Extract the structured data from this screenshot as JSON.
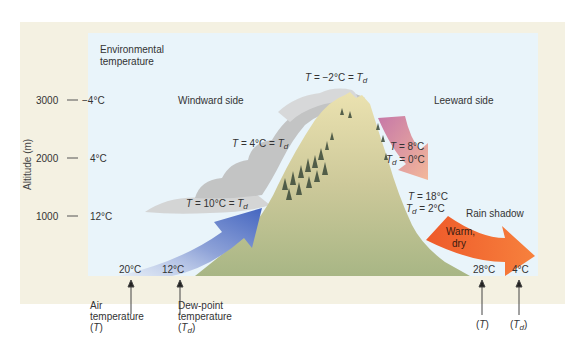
{
  "title_label": {
    "line1": "Environmental",
    "line2": "temperature"
  },
  "y_axis": {
    "label": "Altitude (m)",
    "ticks": [
      {
        "altitude": "3000",
        "temp": "−4°C"
      },
      {
        "altitude": "2000",
        "temp": "4°C"
      },
      {
        "altitude": "1000",
        "temp": "12°C"
      }
    ]
  },
  "regions": {
    "windward": "Windward side",
    "leeward": "Leeward side",
    "rain_shadow": "Rain shadow"
  },
  "windward_labels": {
    "t10": {
      "prefix": "T",
      "mid": " = 10°C = ",
      "suffix": "T",
      "sub": "d"
    },
    "t4": {
      "prefix": "T",
      "mid": " = 4°C = ",
      "suffix": "T",
      "sub": "d"
    },
    "peak": {
      "prefix": "T",
      "mid": " = −2°C = ",
      "suffix": "T",
      "sub": "d"
    }
  },
  "leeward_labels": {
    "t8": {
      "prefix": "T",
      "value": " = 8°C"
    },
    "td0": {
      "prefix": "T",
      "sub": "d",
      "value": " = 0°C"
    },
    "t18": {
      "prefix": "T",
      "value": " = 18°C"
    },
    "td2": {
      "prefix": "T",
      "sub": "d",
      "value": " = 2°C"
    },
    "warm_dry_1": "Warm,",
    "warm_dry_2": "dry"
  },
  "base_values": {
    "air_temp_start": "20°C",
    "dewpoint_start": "12°C",
    "air_temp_end": "28°C",
    "dewpoint_end": "4°C"
  },
  "callouts": {
    "air": {
      "line1": "Air",
      "line2": "temperature",
      "line3_open": "(",
      "line3_sym": "T",
      "line3_close": ")"
    },
    "dew": {
      "line1": "Dew-point",
      "line2": "temperature",
      "line3_open": "(",
      "line3_sym": "T",
      "line3_sub": "d",
      "line3_close": ")"
    },
    "air_end": {
      "open": "(",
      "sym": "T",
      "close": ")"
    },
    "dew_end": {
      "open": "(",
      "sym": "T",
      "sub": "d",
      "close": ")"
    }
  },
  "colors": {
    "frame": "#f4f1e2",
    "sky": "#e9f4fa",
    "mountain_upper": "#e3dca6",
    "mountain_lower": "#a9b886",
    "cloud": "#c9c9c9",
    "arrow_blue": "#4f6fc4",
    "arrow_pink": "#c97aa8",
    "arrow_orange": "#f06a30"
  }
}
